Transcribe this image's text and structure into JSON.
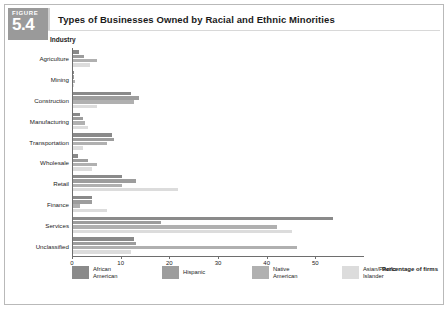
{
  "figure": {
    "word": "FIGURE",
    "number": "5.4"
  },
  "title": "Types of Businesses Owned by Racial and Ethnic Minorities",
  "axis_header": "Industry",
  "axis_title": "Percentage\nof firms",
  "colors": {
    "series": [
      "#8a8a8a",
      "#9d9d9d",
      "#b0b0b0",
      "#dcdcdc"
    ],
    "badge": "#9a9a9a",
    "frame": "#b9b9b9",
    "axis": "#6e6e6e"
  },
  "chart_data": {
    "type": "bar",
    "orientation": "horizontal",
    "title": "Types of Businesses Owned by Racial and Ethnic Minorities",
    "xlabel": "Percentage of firms",
    "ylabel": "Industry",
    "xlim": [
      0,
      60
    ],
    "xticks": [
      0,
      10,
      20,
      30,
      40,
      50
    ],
    "grid": false,
    "legend_position": "bottom",
    "categories": [
      "Agriculture",
      "Mining",
      "Construction",
      "Manufacturing",
      "Transportation",
      "Wholesale",
      "Retail",
      "Finance",
      "Services",
      "Unclassified"
    ],
    "series": [
      {
        "name": "African American",
        "color": "#8a8a8a",
        "values": [
          1.3,
          0.3,
          12.0,
          1.5,
          8.0,
          1.0,
          10.0,
          4.0,
          53.5,
          12.5
        ]
      },
      {
        "name": "Hispanic",
        "color": "#9d9d9d",
        "values": [
          2.2,
          0.3,
          13.5,
          2.0,
          8.5,
          3.0,
          13.0,
          4.0,
          18.0,
          13.0
        ]
      },
      {
        "name": "Native American",
        "color": "#b0b0b0",
        "values": [
          5.0,
          0.5,
          12.5,
          2.5,
          7.0,
          5.0,
          10.0,
          1.5,
          42.0,
          46.0
        ]
      },
      {
        "name": "Asian/Pacific Islander",
        "color": "#dcdcdc",
        "values": [
          3.5,
          0.3,
          5.0,
          3.0,
          2.0,
          4.0,
          21.5,
          7.0,
          45.0,
          12.0
        ]
      }
    ]
  },
  "legend": [
    "African\nAmerican",
    "Hispanic",
    "Native\nAmerican",
    "Asian/Pacific\nIslander"
  ]
}
